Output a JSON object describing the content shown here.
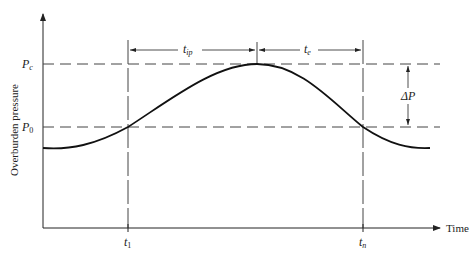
{
  "diagram": {
    "y_axis_label": "Overburden pressure",
    "x_axis_label": "Time",
    "levels": {
      "pc": {
        "main": "P",
        "sub": "c"
      },
      "p0": {
        "main": "P",
        "sub": "0"
      }
    },
    "times": {
      "t1": {
        "main": "t",
        "sub": "1"
      },
      "tn": {
        "main": "t",
        "sub": "n"
      }
    },
    "intervals": {
      "tip": {
        "main": "t",
        "sub": "ip"
      },
      "te": {
        "main": "t",
        "sub": "e"
      }
    },
    "delta_p": {
      "main": "ΔP"
    },
    "colors": {
      "line": "#222222",
      "dash": "#444444",
      "background": "#ffffff"
    }
  }
}
